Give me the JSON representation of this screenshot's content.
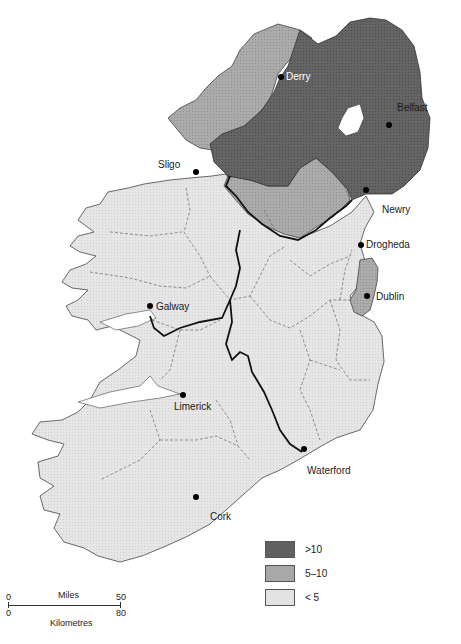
{
  "map": {
    "title": "",
    "colors": {
      "high": "#606060",
      "mid": "#a8a8a8",
      "low": "#e3e3e3",
      "water": "#ffffff",
      "border_heavy": "#111111",
      "border_county": "#555555"
    },
    "cities": [
      {
        "name": "Derry",
        "x": 281,
        "y": 77
      },
      {
        "name": "Belfast",
        "x": 389,
        "y": 125
      },
      {
        "name": "Sligo",
        "x": 196,
        "y": 172
      },
      {
        "name": "Newry",
        "x": 366,
        "y": 190
      },
      {
        "name": "Drogheda",
        "x": 361,
        "y": 245
      },
      {
        "name": "Dublin",
        "x": 367,
        "y": 296
      },
      {
        "name": "Galway",
        "x": 150,
        "y": 306
      },
      {
        "name": "Limerick",
        "x": 183,
        "y": 395
      },
      {
        "name": "Waterford",
        "x": 304,
        "y": 449
      },
      {
        "name": "Cork",
        "x": 196,
        "y": 497
      }
    ],
    "legend": {
      "items": [
        {
          "label": ">10",
          "color": "#606060"
        },
        {
          "label": "5–10",
          "color": "#a8a8a8"
        },
        {
          "label": "< 5",
          "color": "#e3e3e3"
        }
      ]
    },
    "scale_bar": {
      "top_unit": "Miles",
      "bottom_unit": "Kilometres",
      "miles_start": "0",
      "miles_end": "50",
      "km_start": "0",
      "km_end": "80"
    }
  }
}
